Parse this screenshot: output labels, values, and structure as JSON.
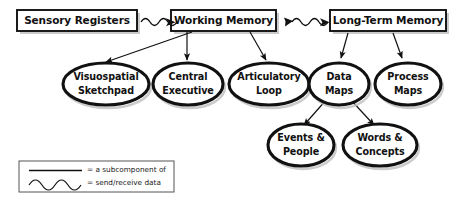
{
  "diagram": {
    "colors": {
      "background": "#ffffff",
      "stroke": "#111111",
      "shadow": "#b9b9b9",
      "legend_border": "#555555"
    },
    "top_boxes": [
      {
        "id": "sensory-registers",
        "label": "Sensory Registers"
      },
      {
        "id": "working-memory",
        "label": "Working Memory"
      },
      {
        "id": "long-term-memory",
        "label": "Long-Term Memory"
      }
    ],
    "ellipses_middle": [
      {
        "id": "visuospatial-sketchpad",
        "line1": "Visuospatial",
        "line2": "Sketchpad"
      },
      {
        "id": "central-executive",
        "line1": "Central",
        "line2": "Executive"
      },
      {
        "id": "articulatory-loop",
        "line1": "Articulatory",
        "line2": "Loop"
      },
      {
        "id": "data-maps",
        "line1": "Data",
        "line2": "Maps"
      },
      {
        "id": "process-maps",
        "line1": "Process",
        "line2": "Maps"
      }
    ],
    "ellipses_bottom": [
      {
        "id": "events-and-people",
        "line1": "Events &",
        "line2": "People"
      },
      {
        "id": "words-and-concepts",
        "line1": "Words &",
        "line2": "Concepts"
      }
    ],
    "legend": {
      "solid_label": "= a subcomponent of",
      "wave_label": "= send/receive data"
    },
    "connections": {
      "wave_edges": [
        {
          "from": "sensory-registers",
          "to": "working-memory"
        },
        {
          "from": "working-memory",
          "to": "long-term-memory"
        }
      ],
      "subcomponent_edges": [
        {
          "from": "working-memory",
          "to": "visuospatial-sketchpad"
        },
        {
          "from": "working-memory",
          "to": "central-executive"
        },
        {
          "from": "working-memory",
          "to": "articulatory-loop"
        },
        {
          "from": "long-term-memory",
          "to": "data-maps"
        },
        {
          "from": "long-term-memory",
          "to": "process-maps"
        },
        {
          "from": "data-maps",
          "to": "events-and-people"
        },
        {
          "from": "data-maps",
          "to": "words-and-concepts"
        }
      ]
    }
  }
}
